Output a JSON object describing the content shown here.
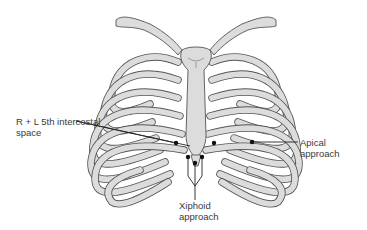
{
  "diagram": {
    "colors": {
      "bone_fill": "#dcdcdc",
      "outline": "#555555",
      "marker": "#111111",
      "text": "#3a3a3a"
    },
    "labels": {
      "intercostal_line1": "R + L 5th intercostal",
      "intercostal_line2": "space",
      "apical": "Apical approach",
      "xiphoid_line1": "Xiphoid",
      "xiphoid_line2": "approach"
    },
    "markers": [
      {
        "name": "right-5th-intercostal",
        "x": 176,
        "y": 143
      },
      {
        "name": "left-5th-intercostal",
        "x": 214,
        "y": 143
      },
      {
        "name": "xiphoid-left",
        "x": 188,
        "y": 157
      },
      {
        "name": "xiphoid-right",
        "x": 202,
        "y": 157
      },
      {
        "name": "xiphoid-center",
        "x": 195,
        "y": 163
      },
      {
        "name": "apical",
        "x": 252,
        "y": 142
      }
    ]
  }
}
